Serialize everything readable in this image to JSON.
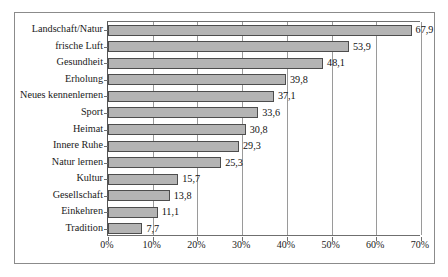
{
  "chart_data": {
    "type": "bar",
    "orientation": "horizontal",
    "title": "",
    "subtitle": "",
    "xlabel": "",
    "ylabel": "",
    "xlim": [
      0,
      70
    ],
    "grid": true,
    "legend": false,
    "legend_position": "none",
    "xtick_labels": [
      "0%",
      "10%",
      "20%",
      "30%",
      "40%",
      "50%",
      "60%",
      "70%"
    ],
    "xtick_values": [
      0,
      10,
      20,
      30,
      40,
      50,
      60,
      70
    ],
    "categories": [
      "Landschaft/Natur",
      "frische Luft",
      "Gesundheit",
      "Erholung",
      "Neues kennenlernen",
      "Sport",
      "Heimat",
      "Innere Ruhe",
      "Natur lernen",
      "Kultur",
      "Gesellschaft",
      "Einkehren",
      "Tradition"
    ],
    "values": [
      67.9,
      53.9,
      48.1,
      39.8,
      37.1,
      33.6,
      30.8,
      29.3,
      25.3,
      15.7,
      13.8,
      11.1,
      7.7
    ],
    "value_labels": [
      "67,9",
      "53,9",
      "48,1",
      "39,8",
      "37,1",
      "33,6",
      "30,8",
      "29,3",
      "25,3",
      "15,7",
      "13,8",
      "11,1",
      "7,7"
    ],
    "bar_color": "#b4b4b4",
    "bar_border_color": "#4d4d4d",
    "gridline_color": "#9a9a9a",
    "axis_color": "#6f6f6f",
    "frame_color": "#8b8b8b",
    "text_color": "#1a1a1a"
  }
}
